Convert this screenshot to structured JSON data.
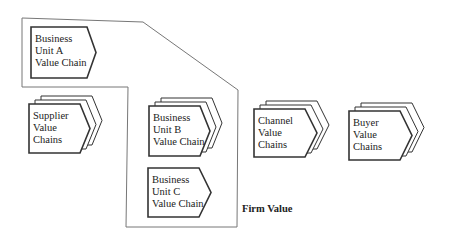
{
  "diagram": {
    "firm_label": "Firm Value",
    "nodes": [
      {
        "id": "unit-a",
        "lines": [
          "Business",
          "Unit A",
          "Value Chain"
        ],
        "stacked": false,
        "x": 31,
        "y": 27,
        "w": 56,
        "h": 51,
        "tip": 9
      },
      {
        "id": "supplier",
        "lines": [
          "Supplier",
          "Value",
          "Chains"
        ],
        "stacked": true,
        "x": 29,
        "y": 104,
        "w": 51,
        "h": 49,
        "tip": 10
      },
      {
        "id": "unit-b",
        "lines": [
          "Business",
          "Unit B",
          "Value Chain"
        ],
        "stacked": true,
        "x": 149,
        "y": 106,
        "w": 51,
        "h": 50,
        "tip": 10
      },
      {
        "id": "unit-c",
        "lines": [
          "Business",
          "Unit C",
          "Value Chain"
        ],
        "stacked": false,
        "x": 148,
        "y": 168,
        "w": 51,
        "h": 49,
        "tip": 12
      },
      {
        "id": "channel",
        "lines": [
          "Channel",
          "Value",
          "Chains"
        ],
        "stacked": true,
        "x": 254,
        "y": 109,
        "w": 51,
        "h": 48,
        "tip": 12
      },
      {
        "id": "buyer",
        "lines": [
          "Buyer",
          "Value",
          "Chains"
        ],
        "stacked": true,
        "x": 349,
        "y": 111,
        "w": 51,
        "h": 49,
        "tip": 12
      }
    ],
    "colors": {
      "stroke": "#333333",
      "boundary": "#777777",
      "text": "#222222"
    }
  }
}
